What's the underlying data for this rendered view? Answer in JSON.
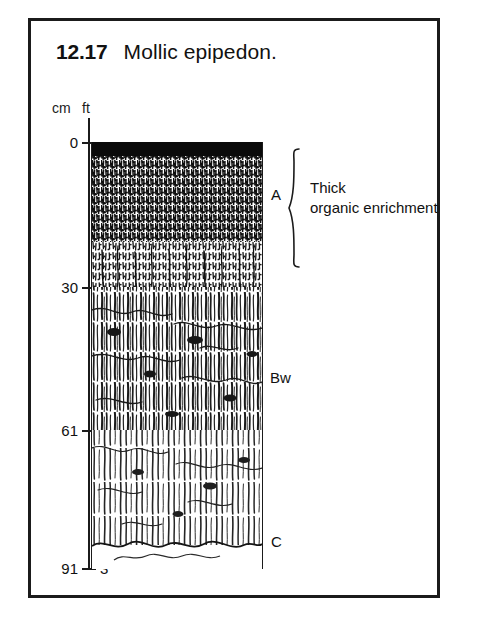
{
  "figure": {
    "number": "12.17",
    "title": "Mollic epipedon.",
    "frame_color": "#1b1b1b",
    "background_color": "#ffffff"
  },
  "axis": {
    "unit_left": "cm",
    "unit_right": "ft",
    "ticks": [
      {
        "cm": "0",
        "ft": "",
        "y": 142
      },
      {
        "cm": "30",
        "ft": "1",
        "y": 287
      },
      {
        "cm": "61",
        "ft": "2",
        "y": 430
      },
      {
        "cm": "91",
        "ft": "3",
        "y": 568
      }
    ]
  },
  "horizons": [
    {
      "label": "A",
      "name": "a-horizon",
      "top_cm": 0,
      "bottom_cm": 30,
      "texture": "dense-dark-stipple",
      "color": "#151515",
      "description": "Thick dark organic-rich mollic surface horizon"
    },
    {
      "label": "Bw",
      "name": "bw-horizon",
      "top_cm": 30,
      "bottom_cm": 61,
      "texture": "vertical-streaks",
      "color": "#2a2a2a",
      "description": "Weathered subsoil with blocky structure"
    },
    {
      "label": "C",
      "name": "c-horizon",
      "top_cm": 61,
      "bottom_cm": 91,
      "texture": "sparse-streaks-wavy-boundary",
      "color": "#3a3a3a",
      "description": "Weakly altered parent material"
    }
  ],
  "annotation": {
    "line1": "Thick",
    "line2": "organic enrichment",
    "brace_target": "A"
  },
  "surface": {
    "vegetation": "grass-blades"
  }
}
